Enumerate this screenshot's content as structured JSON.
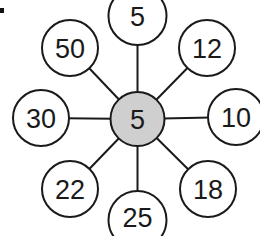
{
  "diagram": {
    "type": "star-network",
    "bullet_color": "#111111",
    "line_color": "#1a1a1a",
    "outer_fill": "#ffffff",
    "center_fill": "#cfcfcf",
    "center": {
      "label": "5"
    },
    "outer": [
      {
        "position": "top",
        "label": "5"
      },
      {
        "position": "top-right",
        "label": "12"
      },
      {
        "position": "right",
        "label": "10"
      },
      {
        "position": "bottom-right",
        "label": "18"
      },
      {
        "position": "bottom",
        "label": "25"
      },
      {
        "position": "bottom-left",
        "label": "22"
      },
      {
        "position": "left",
        "label": "30"
      },
      {
        "position": "top-left",
        "label": "50"
      }
    ]
  }
}
